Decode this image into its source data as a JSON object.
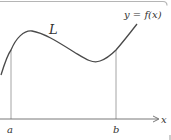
{
  "figure": {
    "curve_label": "L",
    "function_label": "y = f(x)",
    "axis_label": "x",
    "left_bound_label": "a",
    "right_bound_label": "b"
  },
  "colors": {
    "curve": "#4a4a4a",
    "axis": "#6a6a6a",
    "guide_lines": "#9a9a9a",
    "frame": "#b5b5b5"
  }
}
